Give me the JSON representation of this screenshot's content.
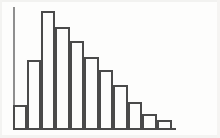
{
  "figure": {
    "kind": "histogram-figure",
    "width_px": 220,
    "height_px": 138,
    "background_color": "#fdfdfc",
    "ink_color": "#4a4a4a",
    "axis_color": "#8f8f8f",
    "bar_fill": "none",
    "bar_stroke_width_px": 2
  },
  "axes": {
    "y_axis": {
      "name": "y-axis-spine",
      "x_px": 13,
      "top_px": 7,
      "bottom_px": 128,
      "has_ticks": false,
      "has_tick_labels": false,
      "label": ""
    },
    "x_axis": {
      "name": "x-axis-baseline",
      "y_px": 128,
      "left_px": 13,
      "right_px": 176,
      "has_ticks": false,
      "has_tick_labels": false,
      "label": ""
    }
  },
  "chart_data": {
    "type": "bar",
    "title": "",
    "xlabel": "",
    "ylabel": "",
    "grid": false,
    "legend": null,
    "legend_position": "none",
    "annotations": [],
    "orientation": "vertical",
    "bar_gap_px": 0,
    "categories": [
      "1",
      "2",
      "3",
      "4",
      "5",
      "6",
      "7",
      "8",
      "9",
      "10",
      "11"
    ],
    "values": [
      23,
      68,
      117,
      101,
      87,
      71,
      58,
      43,
      26,
      14,
      8
    ],
    "ylim": [
      0,
      121
    ],
    "xlim": [
      0,
      11
    ],
    "bars": [
      {
        "index": 1,
        "label": "1",
        "value": 23,
        "x_px": 13,
        "width_px": 14,
        "top_px": 105,
        "height_px": 23
      },
      {
        "index": 2,
        "label": "2",
        "value": 68,
        "x_px": 27,
        "width_px": 14,
        "top_px": 60,
        "height_px": 68
      },
      {
        "index": 3,
        "label": "3",
        "value": 117,
        "x_px": 41,
        "width_px": 14,
        "top_px": 11,
        "height_px": 117
      },
      {
        "index": 4,
        "label": "4",
        "value": 101,
        "x_px": 55,
        "width_px": 15,
        "top_px": 27,
        "height_px": 101
      },
      {
        "index": 5,
        "label": "5",
        "value": 87,
        "x_px": 70,
        "width_px": 14,
        "top_px": 41,
        "height_px": 87
      },
      {
        "index": 6,
        "label": "6",
        "value": 71,
        "x_px": 84,
        "width_px": 15,
        "top_px": 57,
        "height_px": 71
      },
      {
        "index": 7,
        "label": "7",
        "value": 58,
        "x_px": 99,
        "width_px": 14,
        "top_px": 70,
        "height_px": 58
      },
      {
        "index": 8,
        "label": "8",
        "value": 43,
        "x_px": 113,
        "width_px": 15,
        "top_px": 85,
        "height_px": 43
      },
      {
        "index": 9,
        "label": "9",
        "value": 26,
        "x_px": 128,
        "width_px": 14,
        "top_px": 102,
        "height_px": 26
      },
      {
        "index": 10,
        "label": "10",
        "value": 14,
        "x_px": 142,
        "width_px": 15,
        "top_px": 114,
        "height_px": 14
      },
      {
        "index": 11,
        "label": "11",
        "value": 8,
        "x_px": 157,
        "width_px": 15,
        "top_px": 120,
        "height_px": 8
      }
    ]
  }
}
